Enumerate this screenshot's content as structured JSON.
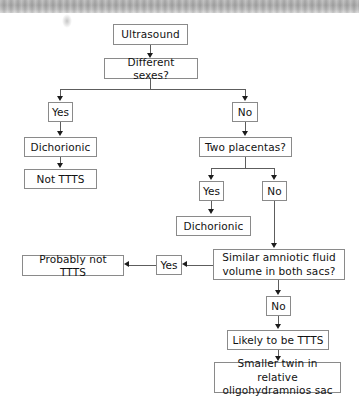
{
  "diagram": {
    "type": "flowchart",
    "nodes": [
      {
        "id": "ultrasound",
        "label": "Ultrasound"
      },
      {
        "id": "different_sexes",
        "label": "Different sexes?"
      },
      {
        "id": "sexes_yes",
        "label": "Yes"
      },
      {
        "id": "sexes_no",
        "label": "No"
      },
      {
        "id": "dichorionic_left",
        "label": "Dichorionic"
      },
      {
        "id": "not_ttts",
        "label": "Not TTTS"
      },
      {
        "id": "two_placentas",
        "label": "Two placentas?"
      },
      {
        "id": "placentas_yes",
        "label": "Yes"
      },
      {
        "id": "placentas_no",
        "label": "No"
      },
      {
        "id": "dichorionic_mid",
        "label": "Dichorionic"
      },
      {
        "id": "similar_fluid_l1",
        "label": "Similar amniotic fluid"
      },
      {
        "id": "similar_fluid_l2",
        "label": "volume in both sacs?"
      },
      {
        "id": "fluid_yes",
        "label": "Yes"
      },
      {
        "id": "probably_not_ttts",
        "label": "Probably not TTTS"
      },
      {
        "id": "fluid_no",
        "label": "No"
      },
      {
        "id": "likely_ttts",
        "label": "Likely to be TTTS"
      },
      {
        "id": "smaller_twin_l1",
        "label": "Smaller twin in relative"
      },
      {
        "id": "smaller_twin_l2",
        "label": "oligohydramnios sac"
      }
    ],
    "colors": {
      "box_border": "#8a8a8a",
      "connector": "#5d5d5d",
      "arrow": "#1c1c1c",
      "text": "#121212",
      "page_background": "#ffffff"
    }
  }
}
